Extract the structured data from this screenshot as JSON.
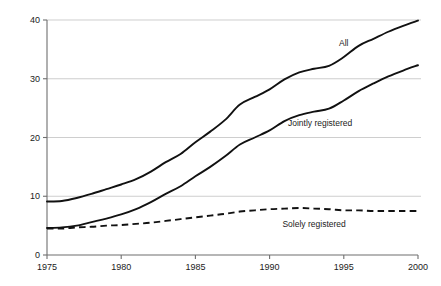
{
  "chart_data": {
    "type": "line",
    "title": "",
    "subtitle": "",
    "xlabel": "",
    "ylabel": "",
    "xlim": [
      1975,
      2000
    ],
    "ylim": [
      0,
      40
    ],
    "xticks": [
      1975,
      1980,
      1985,
      1990,
      1995,
      2000
    ],
    "yticks": [
      0,
      10,
      20,
      30,
      40
    ],
    "xtick_labels": [
      "1975",
      "1980",
      "1985",
      "1990",
      "1995",
      "2000"
    ],
    "ytick_labels": [
      "0",
      "10",
      "20",
      "30",
      "40"
    ],
    "grid": "horizontal",
    "legend_position": "inline-annotations",
    "x": [
      1975,
      1976,
      1977,
      1978,
      1979,
      1980,
      1981,
      1982,
      1983,
      1984,
      1985,
      1986,
      1987,
      1988,
      1989,
      1990,
      1991,
      1992,
      1993,
      1994,
      1995,
      1996,
      1997,
      1998,
      1999,
      2000
    ],
    "series": [
      {
        "name": "All",
        "style": "solid",
        "values": [
          9.1,
          9.2,
          9.7,
          10.4,
          11.2,
          12.0,
          12.9,
          14.2,
          15.8,
          17.2,
          19.2,
          21.0,
          23.0,
          25.6,
          26.9,
          28.2,
          29.9,
          31.1,
          31.7,
          32.2,
          33.7,
          35.6,
          36.8,
          38.0,
          39.0,
          39.9
        ]
      },
      {
        "name": "Jointly registered",
        "style": "solid",
        "values": [
          4.6,
          4.7,
          5.0,
          5.6,
          6.2,
          6.9,
          7.8,
          9.0,
          10.4,
          11.7,
          13.4,
          15.0,
          16.8,
          18.8,
          20.0,
          21.2,
          22.8,
          23.8,
          24.4,
          24.9,
          26.3,
          27.9,
          29.2,
          30.4,
          31.4,
          32.3
        ]
      },
      {
        "name": "Solely registered",
        "style": "dashed",
        "values": [
          4.5,
          4.5,
          4.7,
          4.8,
          5.0,
          5.1,
          5.3,
          5.5,
          5.8,
          6.1,
          6.4,
          6.7,
          7.0,
          7.4,
          7.6,
          7.8,
          7.9,
          8.0,
          7.9,
          7.8,
          7.6,
          7.6,
          7.5,
          7.5,
          7.5,
          7.5
        ]
      }
    ],
    "annotations": [
      {
        "text": "All",
        "x": 1995.0,
        "y": 35.5
      },
      {
        "text": "Jointly registered",
        "x": 1993.4,
        "y": 22.0
      },
      {
        "text": "Solely registered",
        "x": 1993.0,
        "y": 4.8
      }
    ],
    "colors": {
      "line": "#111111",
      "grid": "#b9b9b9",
      "axis": "#6f6f6f",
      "text": "#1b1b1b",
      "background": "#ffffff"
    }
  }
}
